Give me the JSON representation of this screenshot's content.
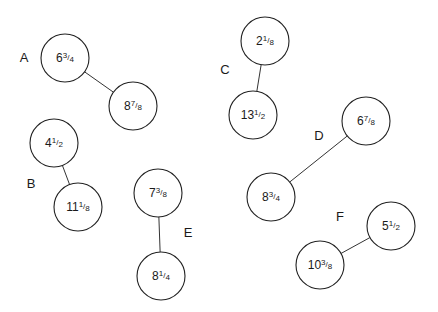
{
  "diagram": {
    "type": "paired-node-diagram",
    "pairs": [
      {
        "label": "A",
        "label_pos": [
          24,
          57
        ],
        "nodes": [
          {
            "whole": "6",
            "num": "3",
            "den": "4",
            "text": "6¾",
            "cx": 65,
            "cy": 58
          },
          {
            "whole": "8",
            "num": "7",
            "den": "8",
            "text": "8⅞",
            "cx": 133,
            "cy": 106
          }
        ]
      },
      {
        "label": "B",
        "label_pos": [
          31,
          183
        ],
        "nodes": [
          {
            "whole": "4",
            "num": "1",
            "den": "2",
            "text": "4½",
            "cx": 54,
            "cy": 143
          },
          {
            "whole": "11",
            "num": "1",
            "den": "8",
            "text": "11⅛",
            "cx": 78,
            "cy": 207
          }
        ]
      },
      {
        "label": "C",
        "label_pos": [
          225,
          69
        ],
        "nodes": [
          {
            "whole": "2",
            "num": "1",
            "den": "8",
            "text": "2⅛",
            "cx": 265,
            "cy": 41
          },
          {
            "whole": "13",
            "num": "1",
            "den": "2",
            "text": "13½",
            "cx": 253,
            "cy": 115
          }
        ]
      },
      {
        "label": "D",
        "label_pos": [
          319,
          135
        ],
        "nodes": [
          {
            "whole": "6",
            "num": "7",
            "den": "8",
            "text": "6⅞",
            "cx": 366,
            "cy": 121
          },
          {
            "whole": "8",
            "num": "3",
            "den": "4",
            "text": "8¾",
            "cx": 271,
            "cy": 197
          }
        ]
      },
      {
        "label": "E",
        "label_pos": [
          188,
          232
        ],
        "nodes": [
          {
            "whole": "7",
            "num": "3",
            "den": "8",
            "text": "7⅜",
            "cx": 158,
            "cy": 193
          },
          {
            "whole": "8",
            "num": "1",
            "den": "4",
            "text": "8¼",
            "cx": 161,
            "cy": 276
          }
        ]
      },
      {
        "label": "F",
        "label_pos": [
          340,
          216
        ],
        "nodes": [
          {
            "whole": "5",
            "num": "1",
            "den": "2",
            "text": "5½",
            "cx": 391,
            "cy": 226
          },
          {
            "whole": "10",
            "num": "3",
            "den": "8",
            "text": "10⅜",
            "cx": 320,
            "cy": 265
          }
        ]
      }
    ],
    "node_radius": 24
  }
}
